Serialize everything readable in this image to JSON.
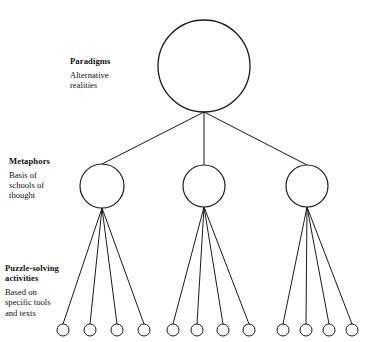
{
  "diagram": {
    "stroke_color": "#1a1a1a",
    "fill_color": "#ffffff",
    "background_color": "#ffffff",
    "levels": [
      {
        "id": "paradigms",
        "title": "Paradigms",
        "description": "Alternative\nrealities",
        "node_count": 1
      },
      {
        "id": "metaphors",
        "title": "Metaphors",
        "description": "Basis of\nschools of\nthought",
        "node_count": 3
      },
      {
        "id": "puzzle-solving",
        "title": "Puzzle-solving\nactivities",
        "description": "Based on\nspecific tools\nand texts",
        "node_count": 12
      }
    ],
    "nodes": {
      "root": {
        "cx": 204,
        "cy": 66,
        "r": 46
      },
      "metaphors": [
        {
          "cx": 102,
          "cy": 186,
          "r": 22
        },
        {
          "cx": 204,
          "cy": 186,
          "r": 21
        },
        {
          "cx": 307,
          "cy": 186,
          "r": 21
        }
      ],
      "activities": [
        {
          "cx": 63,
          "cy": 330,
          "r": 6
        },
        {
          "cx": 90,
          "cy": 330,
          "r": 6
        },
        {
          "cx": 117,
          "cy": 330,
          "r": 6
        },
        {
          "cx": 144,
          "cy": 330,
          "r": 6
        },
        {
          "cx": 173,
          "cy": 330,
          "r": 6
        },
        {
          "cx": 197,
          "cy": 330,
          "r": 6
        },
        {
          "cx": 223,
          "cy": 330,
          "r": 6
        },
        {
          "cx": 249,
          "cy": 330,
          "r": 6
        },
        {
          "cx": 283,
          "cy": 330,
          "r": 6
        },
        {
          "cx": 306,
          "cy": 330,
          "r": 6
        },
        {
          "cx": 329,
          "cy": 330,
          "r": 6
        },
        {
          "cx": 352,
          "cy": 330,
          "r": 6
        }
      ]
    },
    "edges": {
      "root_to_metaphors": [
        {
          "x1": 204,
          "y1": 112,
          "x2": 102,
          "y2": 164
        },
        {
          "x1": 204,
          "y1": 112,
          "x2": 204,
          "y2": 165
        },
        {
          "x1": 204,
          "y1": 112,
          "x2": 307,
          "y2": 165
        }
      ],
      "metaphors_to_activities": [
        {
          "x1": 102,
          "y1": 208,
          "x2": 63,
          "y2": 324
        },
        {
          "x1": 102,
          "y1": 208,
          "x2": 90,
          "y2": 324
        },
        {
          "x1": 102,
          "y1": 208,
          "x2": 117,
          "y2": 324
        },
        {
          "x1": 102,
          "y1": 208,
          "x2": 144,
          "y2": 324
        },
        {
          "x1": 204,
          "y1": 207,
          "x2": 173,
          "y2": 324
        },
        {
          "x1": 204,
          "y1": 207,
          "x2": 197,
          "y2": 324
        },
        {
          "x1": 204,
          "y1": 207,
          "x2": 223,
          "y2": 324
        },
        {
          "x1": 204,
          "y1": 207,
          "x2": 249,
          "y2": 324
        },
        {
          "x1": 307,
          "y1": 207,
          "x2": 283,
          "y2": 324
        },
        {
          "x1": 307,
          "y1": 207,
          "x2": 306,
          "y2": 324
        },
        {
          "x1": 307,
          "y1": 207,
          "x2": 329,
          "y2": 324
        },
        {
          "x1": 307,
          "y1": 207,
          "x2": 352,
          "y2": 324
        }
      ]
    }
  }
}
